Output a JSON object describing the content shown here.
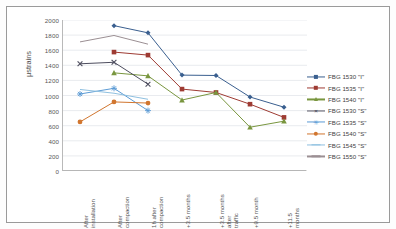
{
  "chart_data": {
    "type": "line",
    "title": "",
    "xlabel": "",
    "ylabel": "μstrains",
    "ylim": [
      0,
      2000
    ],
    "ytick_step": 200,
    "yticks": [
      0,
      200,
      400,
      600,
      800,
      1000,
      1200,
      1400,
      1600,
      1800,
      2000
    ],
    "grid": true,
    "legend_position": "right",
    "categories": [
      "After installation",
      "After compaction",
      "1h after compaction",
      "+3.5 months",
      "+3.5 months after traffic",
      "+9.5 month",
      "+11.5 months"
    ],
    "series": [
      {
        "name": "FBG 1530 \"I\"",
        "color": "#3a5f8f",
        "marker": "diamond",
        "values": [
          null,
          1925,
          1830,
          1270,
          1265,
          980,
          845
        ]
      },
      {
        "name": "FBG 1535 \"I\"",
        "color": "#9e3b33",
        "marker": "square",
        "values": [
          null,
          1575,
          1535,
          1085,
          1040,
          885,
          710
        ]
      },
      {
        "name": "FBG 1540 \"I\"",
        "color": "#79963f",
        "marker": "triangle",
        "values": [
          null,
          1300,
          1260,
          940,
          1040,
          580,
          660
        ]
      },
      {
        "name": "FBG 1530 \"S\"",
        "color": "#4d4d5e",
        "marker": "x",
        "values": [
          1420,
          1440,
          1150,
          null,
          null,
          null,
          null
        ]
      },
      {
        "name": "FBG 1535 \"S\"",
        "color": "#5b9bd5",
        "marker": "star",
        "values": [
          1020,
          1095,
          800,
          null,
          null,
          null,
          null
        ]
      },
      {
        "name": "FBG 1540 \"S\"",
        "color": "#d1762f",
        "marker": "circle",
        "values": [
          650,
          915,
          900,
          null,
          null,
          null,
          null
        ]
      },
      {
        "name": "FBG 1545 \"S\"",
        "color": "#8fc0e0",
        "marker": "line",
        "values": [
          1080,
          1030,
          950,
          null,
          null,
          null,
          null
        ]
      },
      {
        "name": "FBG 1550 \"S\"",
        "color": "#9b8f93",
        "marker": "line",
        "values": [
          1710,
          1795,
          1680,
          null,
          null,
          null,
          null
        ]
      }
    ]
  },
  "legend": {
    "items": [
      {
        "label": "FBG 1530 \"I\""
      },
      {
        "label": "FBG 1535 \"I\""
      },
      {
        "label": "FBG 1540 \"I\""
      },
      {
        "label": "FBG 1530 \"S\""
      },
      {
        "label": "FBG 1535 \"S\""
      },
      {
        "label": "FBG 1540 \"S\""
      },
      {
        "label": "FBG 1545 \"S\""
      },
      {
        "label": "FBG 1550 \"S\""
      }
    ]
  },
  "axes": {
    "y_title": "μstrains"
  }
}
